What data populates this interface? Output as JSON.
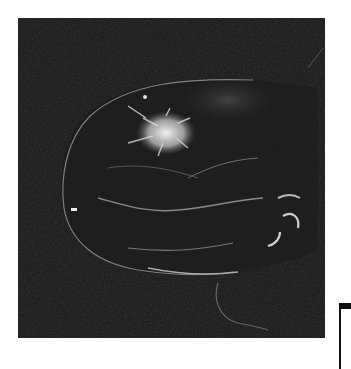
{
  "image": {
    "type": "breast-mri-sagittal",
    "background_color": "#121212",
    "foreground_color": "#e8e8e8",
    "features": [
      "enhancing-spiculated-lesion",
      "breast-contour",
      "vessels",
      "skin-line"
    ]
  }
}
